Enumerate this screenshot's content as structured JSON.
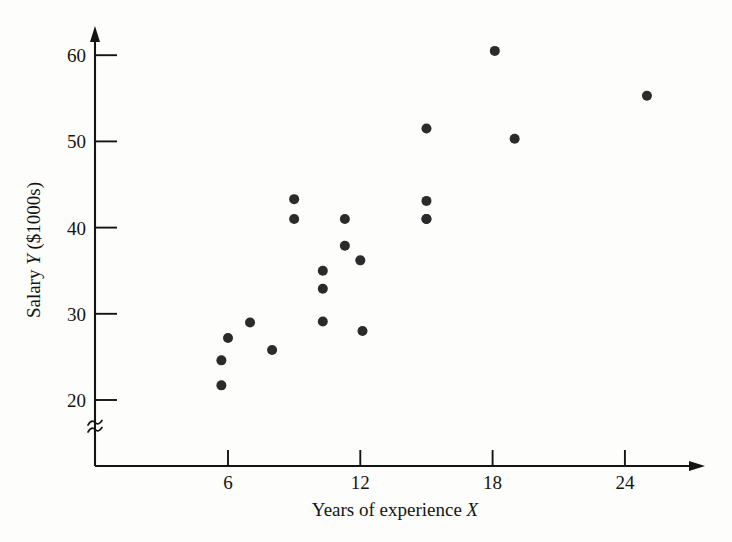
{
  "chart_data": {
    "type": "scatter",
    "title": "",
    "xlabel": "Years of experience X",
    "xlabel_text": "Years of experience",
    "xlabel_symbol": "X",
    "ylabel": "Salary Y ($1000s)",
    "ylabel_prefix": "Salary",
    "ylabel_symbol": "Y",
    "ylabel_suffix": "($1000s)",
    "xlim": [
      3.0,
      28.5
    ],
    "ylim": [
      18.2,
      62.5
    ],
    "xticks": [
      6,
      12,
      18,
      24
    ],
    "xtick_labels": [
      "6",
      "12",
      "18",
      "24"
    ],
    "yticks": [
      20,
      30,
      40,
      50,
      60
    ],
    "ytick_labels": [
      "20",
      "30",
      "40",
      "50",
      "60"
    ],
    "grid": false,
    "legend": null,
    "axis_break": {
      "axis": "y",
      "symbol": "≈",
      "below_value": 20
    },
    "marker": {
      "shape": "circle",
      "radius_px": 5,
      "color": "#2b2b2b"
    },
    "n_points": 21,
    "points": [
      {
        "x": 5.7,
        "y": 24.6
      },
      {
        "x": 5.7,
        "y": 21.7
      },
      {
        "x": 6.0,
        "y": 27.2
      },
      {
        "x": 7.0,
        "y": 29.0
      },
      {
        "x": 8.0,
        "y": 25.8
      },
      {
        "x": 9.0,
        "y": 43.3
      },
      {
        "x": 9.0,
        "y": 41.0
      },
      {
        "x": 10.3,
        "y": 35.0
      },
      {
        "x": 10.3,
        "y": 32.9
      },
      {
        "x": 10.3,
        "y": 29.1
      },
      {
        "x": 11.3,
        "y": 41.0
      },
      {
        "x": 11.3,
        "y": 37.9
      },
      {
        "x": 12.0,
        "y": 36.2
      },
      {
        "x": 12.1,
        "y": 28.0
      },
      {
        "x": 15.0,
        "y": 51.5
      },
      {
        "x": 15.0,
        "y": 43.1
      },
      {
        "x": 15.0,
        "y": 41.0
      },
      {
        "x": 18.1,
        "y": 60.5
      },
      {
        "x": 19.0,
        "y": 50.3
      },
      {
        "x": 25.0,
        "y": 55.3
      },
      {
        "x": 15.0,
        "y": 41.0
      }
    ]
  },
  "colors": {
    "marker": "#2b2b2b",
    "axis": "#141414",
    "background": "#fdfdfb",
    "text": "#141414"
  }
}
